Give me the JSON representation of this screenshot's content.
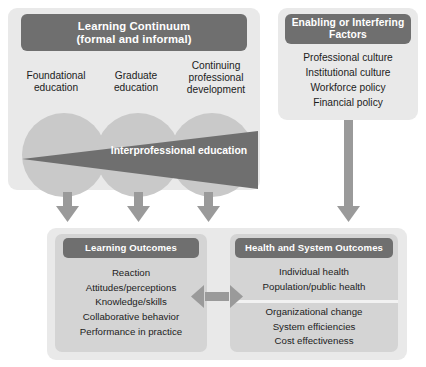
{
  "colors": {
    "panel_bg": "#e9e9e9",
    "header_bar": "#6f6f6f",
    "circle": "#c9c9c9",
    "wedge": "#6f6f6f",
    "box_bg": "#d4d4d4",
    "arrow": "#9a9a9a",
    "text": "#1c1c1c",
    "header_text": "#ffffff"
  },
  "continuum": {
    "header_line1": "Learning Continuum",
    "header_line2": "(formal and informal)",
    "columns": [
      {
        "label": "Foundational education",
        "line1": "Foundational",
        "line2": "education"
      },
      {
        "label": "Graduate education",
        "line1": "Graduate",
        "line2": "education"
      },
      {
        "label": "Continuing professional development",
        "line1": "Continuing",
        "line2": "professional",
        "line3": "development"
      }
    ],
    "wedge_label": "Interprofessional education"
  },
  "factors": {
    "header_line1": "Enabling or Interfering",
    "header_line2": "Factors",
    "items": [
      "Professional culture",
      "Institutional culture",
      "Workforce policy",
      "Financial policy"
    ]
  },
  "learning_outcomes": {
    "header": "Learning Outcomes",
    "items": [
      "Reaction",
      "Attitudes/perceptions",
      "Knowledge/skills",
      "Collaborative behavior",
      "Performance in practice"
    ]
  },
  "health_outcomes": {
    "header": "Health and System Outcomes",
    "group_1": [
      "Individual health",
      "Population/public health"
    ],
    "group_2": [
      "Organizational change",
      "System efficiencies",
      "Cost effectiveness"
    ]
  },
  "connectors": {
    "down_arrow_1": "down-arrow",
    "down_arrow_2": "down-arrow",
    "down_arrow_3": "down-arrow",
    "factors_arrow": "down-arrow-long",
    "between_outcomes": "double-headed-arrow"
  }
}
